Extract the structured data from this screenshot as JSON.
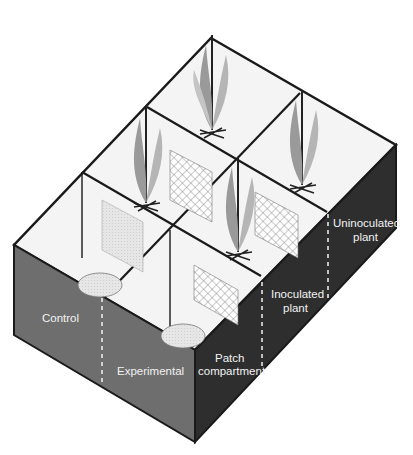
{
  "figure": {
    "type": "isometric-diagram"
  },
  "labels": {
    "control": "Control",
    "experimental": "Experimental",
    "patch_line1": "Patch",
    "patch_line2": "compartment",
    "inoculated_line1": "Inoculated",
    "inoculated_line2": "plant",
    "uninoculated_line1": "Uninoculated",
    "uninoculated_line2": "plant"
  },
  "colors": {
    "left_face": "#6e6e6e",
    "right_face": "#2e2e2e",
    "compartment_floor": "#f4f4f4",
    "walls": "#1a1a1a",
    "label_text": "#f2f2f2",
    "plant": "#9a9a9a"
  }
}
